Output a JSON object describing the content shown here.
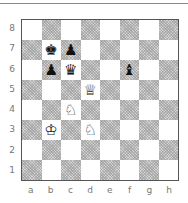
{
  "board": {
    "ranks": [
      "8",
      "7",
      "6",
      "5",
      "4",
      "3",
      "2",
      "1"
    ],
    "files": [
      "a",
      "b",
      "c",
      "d",
      "e",
      "f",
      "g",
      "h"
    ],
    "pieces": {
      "b7": {
        "glyph": "♚",
        "color": "black",
        "name": "black-king"
      },
      "c7": {
        "glyph": "♟",
        "color": "black",
        "name": "black-pawn"
      },
      "b6": {
        "glyph": "♟",
        "color": "black",
        "name": "black-pawn"
      },
      "c6": {
        "glyph": "♛",
        "color": "black",
        "name": "black-queen"
      },
      "f6": {
        "glyph": "♝",
        "color": "black",
        "name": "black-bishop"
      },
      "d5": {
        "glyph": "♕",
        "color": "white",
        "name": "white-queen"
      },
      "c4": {
        "glyph": "♘",
        "color": "white",
        "name": "white-knight"
      },
      "b3": {
        "glyph": "♔",
        "color": "white",
        "name": "white-king"
      },
      "d3": {
        "glyph": "♘",
        "color": "white",
        "name": "white-knight"
      }
    },
    "colors": {
      "light": "#ffffff",
      "dark": "#d4d4d4",
      "border": "#555555",
      "label": "#777777"
    }
  }
}
